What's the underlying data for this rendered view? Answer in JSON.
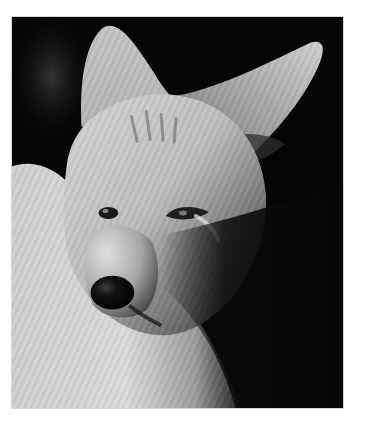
{
  "image": {
    "subject": "coyote",
    "description": "Black-and-white close-up portrait of a coyote looking toward the viewer's left",
    "color_mode": "grayscale",
    "background_color": "#ffffff",
    "frame": {
      "x": 11,
      "y": 16,
      "width": 333,
      "height": 393
    },
    "colors": {
      "backdrop": "#050505",
      "fur_light": "#d9d9d9",
      "fur_mid": "#a8a8a8",
      "fur_dark": "#5a5a5a",
      "shadow": "#0d0d0d",
      "nose": "#080808"
    }
  }
}
